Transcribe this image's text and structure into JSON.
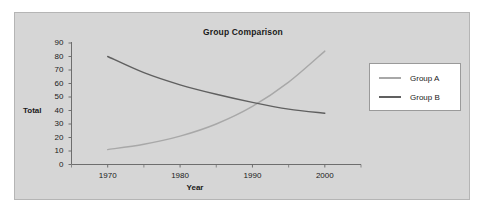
{
  "chart_data": {
    "type": "line",
    "title": "Group Comparison",
    "xlabel": "Year",
    "ylabel": "Total",
    "xlim": [
      1965,
      2005
    ],
    "ylim": [
      0,
      90
    ],
    "grid": false,
    "legend_position": "right",
    "x_ticks": [
      "1970",
      "1980",
      "1990",
      "2000"
    ],
    "x_tick_values": [
      1970,
      1980,
      1990,
      2000
    ],
    "y_ticks": [
      "0",
      "10",
      "20",
      "30",
      "40",
      "50",
      "60",
      "70",
      "80",
      "90"
    ],
    "y_tick_values": [
      0,
      10,
      20,
      30,
      40,
      50,
      60,
      70,
      80,
      90
    ],
    "x": [
      1970,
      1975,
      1980,
      1985,
      1990,
      1995,
      2000
    ],
    "series": [
      {
        "name": "Group A",
        "color": "#a8a8a8",
        "values": [
          11,
          15,
          21,
          30,
          43,
          61,
          84
        ]
      },
      {
        "name": "Group B",
        "color": "#606060",
        "values": [
          80,
          68,
          59,
          52,
          46,
          41,
          38
        ]
      }
    ],
    "annotations": []
  },
  "chart": {
    "title": "Group Comparison",
    "y_axis_title": "Total",
    "x_axis_title": "Year"
  },
  "legend": {
    "items": [
      {
        "label": "Group A"
      },
      {
        "label": "Group B"
      }
    ]
  },
  "colors": {
    "panel_background": "#d6d6d6",
    "page_background": "#ffffff",
    "axis": "#6e6e6e",
    "text": "#1a1a1a",
    "series_a": "#a8a8a8",
    "series_b": "#606060",
    "legend_background": "#ffffff",
    "legend_border": "#9a9a9a"
  }
}
